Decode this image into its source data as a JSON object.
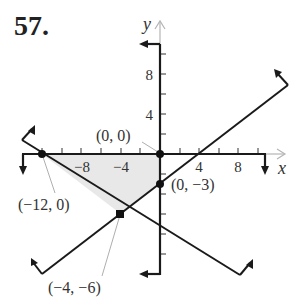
{
  "problem_number": "57.",
  "axes": {
    "x_label": "x",
    "y_label": "y",
    "x_ticks": [
      "−8",
      "−4",
      "4",
      "8"
    ],
    "y_ticks": [
      "8",
      "4"
    ],
    "x_range": [
      -14,
      12
    ],
    "y_range": [
      -12,
      11
    ],
    "tick_spacing": 2
  },
  "vertices": [
    {
      "label": "(0, 0)",
      "x": 0,
      "y": 0
    },
    {
      "label": "(−12, 0)",
      "x": -12,
      "y": 0
    },
    {
      "label": "(0, −3)",
      "x": 0,
      "y": -3
    },
    {
      "label": "(−4, −6)",
      "x": -4,
      "y": -6
    }
  ],
  "boundary_lines": [
    {
      "name": "line-decreasing",
      "equation": "y = -3/4 x - 9"
    },
    {
      "name": "line-increasing",
      "equation": "y = 3/4 x - 3"
    },
    {
      "name": "x-axis",
      "equation": "y = 0"
    },
    {
      "name": "y-axis",
      "equation": "x = 0"
    }
  ],
  "shaded_region": {
    "description": "Feasible region bounded by (-12,0), (0,0), (0,-3), (-4,-6)",
    "fill_color": "#e6e6e6"
  },
  "colors": {
    "line": "#1a1a1a",
    "axis_arrow": "#b0b0b0",
    "leader": "#999999"
  }
}
